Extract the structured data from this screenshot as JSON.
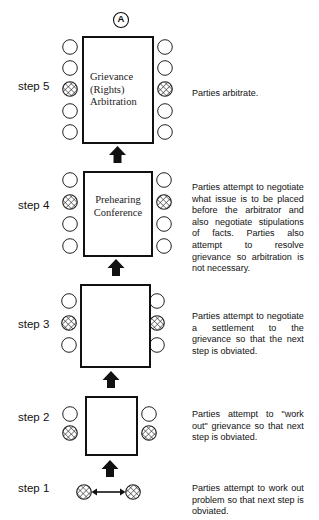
{
  "figure": {
    "marker": "A",
    "colors": {
      "ink": "#111111",
      "background": "#ffffff"
    }
  },
  "steps": [
    {
      "label": "step 5",
      "box_title_lines": [
        "Grievance",
        "(Rights)",
        "Arbitration"
      ],
      "seats_per_side": 5,
      "party_seat_index": 2,
      "description": "Parties arbitrate."
    },
    {
      "label": "step 4",
      "box_title_lines": [
        "Prehearing",
        "Conference"
      ],
      "seats_per_side": 4,
      "party_seat_index": 1,
      "description": "Parties attempt to negotiate what issue is to be placed before the arbitrator and also negotiate stipulations of facts. Parties also attempt to resolve grievance so arbitration is not necessary."
    },
    {
      "label": "step 3",
      "box_title_lines": [],
      "seats_per_side": 3,
      "party_seat_index": 1,
      "description": "Parties attempt to negotiate a settlement to the grievance so that the next step is obviated."
    },
    {
      "label": "step 2",
      "box_title_lines": [],
      "seats_per_side": 2,
      "party_seat_index": 1,
      "description": "Parties attempt to \"work out\" grievance so that next step is obviated."
    },
    {
      "label": "step 1",
      "box_title_lines": [],
      "seats_per_side": 1,
      "party_seat_index": 0,
      "description": "Parties attempt to work out problem so that next step is obviated."
    }
  ],
  "icons": {
    "seat": "empty-circle",
    "party": "crosshatched-circle",
    "escalation": "up-arrow",
    "negotiation": "double-headed-arrow"
  }
}
